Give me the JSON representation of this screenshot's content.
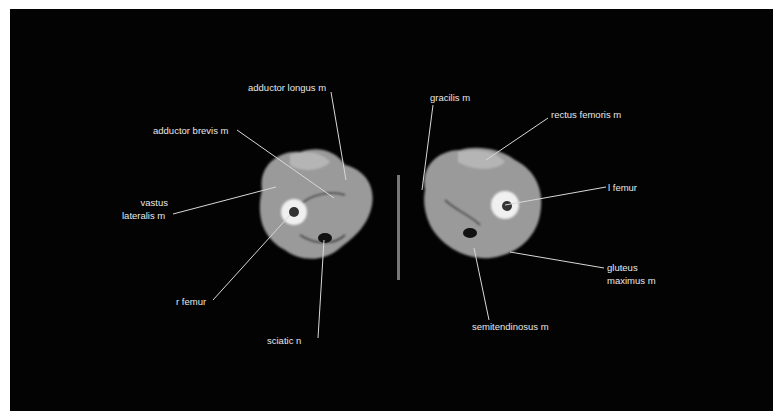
{
  "image": {
    "description": "CT cross-section of thighs with anatomical labels",
    "background": "#030303",
    "line_color": "#d8d8d8"
  },
  "labels": {
    "adductor_longus": "adductor longus m",
    "adductor_brevis": "adductor brevis m",
    "vastus_lateralis_1": "vastus",
    "vastus_lateralis_2": "lateralis m",
    "r_femur": "r femur",
    "sciatic": "sciatic n",
    "gracilis": "gracilis m",
    "rectus_femoris": "rectus femoris m",
    "l_femur": "l femur",
    "gluteus_1": "gluteus",
    "gluteus_2": "maximus m",
    "semitendinosus": "semitendinosus m"
  }
}
